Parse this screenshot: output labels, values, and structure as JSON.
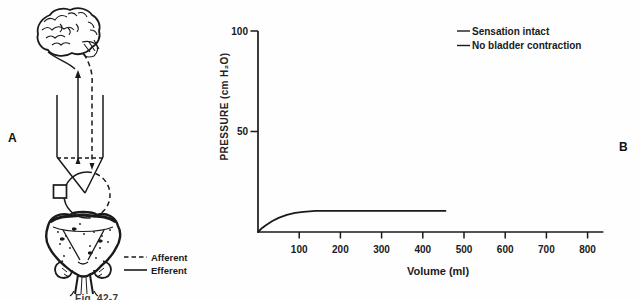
{
  "figure": {
    "panel_a_label": "A",
    "panel_b_label": "B",
    "caption": "Fig. 42-7."
  },
  "diagram": {
    "parts": [
      "brain",
      "spinal-cord-pathway",
      "sacral-reflex-center",
      "lesion-site-marker",
      "bladder"
    ],
    "legend": [
      {
        "label": "Afferent",
        "line_style": "dashed"
      },
      {
        "label": "Efferent",
        "line_style": "solid"
      }
    ]
  },
  "chart_data": {
    "type": "line",
    "title": "",
    "xlabel": "Volume (ml)",
    "ylabel": "PRESSURE (cm H₂O)",
    "xlim": [
      0,
      848
    ],
    "ylim": [
      0,
      100
    ],
    "x_ticks": [
      100,
      200,
      300,
      400,
      500,
      600,
      700,
      800
    ],
    "y_ticks": [
      50,
      100
    ],
    "grid": false,
    "legend_position": "top-right",
    "legend": [
      "Sensation intact",
      "No bladder contraction"
    ],
    "line_color": "#1a1a1a",
    "series": [
      {
        "name": "cystometrogram-curve",
        "x": [
          0,
          10,
          20,
          35,
          50,
          70,
          90,
          110,
          140,
          170,
          250,
          350,
          455
        ],
        "y": [
          0,
          2.0,
          3.5,
          5.5,
          7.0,
          8.5,
          9.5,
          10.0,
          10.5,
          10.5,
          10.5,
          10.5,
          10.5
        ]
      }
    ]
  }
}
